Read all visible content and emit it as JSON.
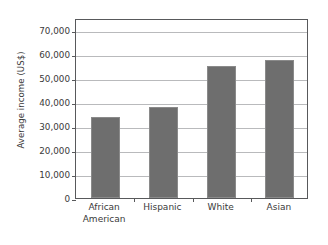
{
  "chart_data": {
    "type": "bar",
    "title": "",
    "xlabel": "",
    "ylabel": "Average income (US$)",
    "categories": [
      "African American",
      "Hispanic",
      "White",
      "Asian"
    ],
    "category_lines": [
      [
        "African",
        "American"
      ],
      [
        "Hispanic"
      ],
      [
        "White"
      ],
      [
        "Asian"
      ]
    ],
    "values": [
      33800,
      38000,
      55000,
      57500
    ],
    "ylim": [
      0,
      75000
    ],
    "yticks": [
      0,
      10000,
      20000,
      30000,
      40000,
      50000,
      60000,
      70000
    ],
    "ytick_labels": [
      "0",
      "10,000",
      "20,000",
      "30,000",
      "40,000",
      "50,000",
      "60,000",
      "70,000"
    ],
    "grid": true,
    "legend": false,
    "legend_position": "none",
    "bar_color": "#6e6e6e",
    "gridline_color": "#b9babc",
    "axis_color": "#58595b",
    "background_color": "#ffffff"
  }
}
